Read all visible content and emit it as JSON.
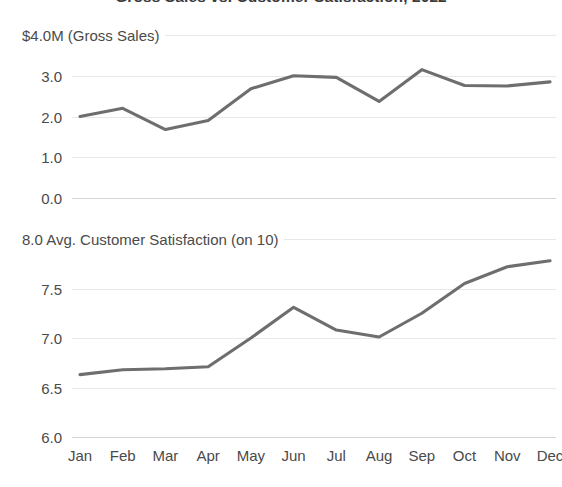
{
  "chart_data": {
    "type": "line",
    "title": "Gross Sales vs. Customer Satisfaction, 2022",
    "xlabel": "",
    "grid": true,
    "legend": "none",
    "categories": [
      "Jan",
      "Feb",
      "Mar",
      "Apr",
      "May",
      "Jun",
      "Jul",
      "Aug",
      "Sep",
      "Oct",
      "Nov",
      "Dec"
    ],
    "panels": [
      {
        "name": "gross-sales",
        "ylabel": "$4.0M (Gross Sales)",
        "unit_label": "$4.0M (Gross Sales)",
        "yticks": [
          "0.0",
          "1.0",
          "2.0",
          "3.0"
        ],
        "ytick_values": [
          0.0,
          1.0,
          2.0,
          3.0
        ],
        "ylim": [
          0.0,
          4.0
        ],
        "series": [
          {
            "name": "Gross Sales",
            "color": "#6e6e6e",
            "values": [
              2.0,
              2.2,
              1.68,
              1.9,
              2.68,
              3.0,
              2.96,
              2.37,
              3.15,
              2.76,
              2.75,
              2.85
            ]
          }
        ]
      },
      {
        "name": "customer-satisfaction",
        "ylabel": "8.0 Avg. Customer Satisfaction (on 10)",
        "unit_label": "8.0 Avg. Customer Satisfaction (on 10)",
        "yticks": [
          "6.0",
          "6.5",
          "7.0",
          "7.5"
        ],
        "ytick_values": [
          6.0,
          6.5,
          7.0,
          7.5
        ],
        "ylim": [
          6.0,
          8.0
        ],
        "series": [
          {
            "name": "Avg. Customer Satisfaction",
            "color": "#6e6e6e",
            "values": [
              6.63,
              6.68,
              6.69,
              6.71,
              7.0,
              7.31,
              7.08,
              7.01,
              7.25,
              7.55,
              7.72,
              7.78
            ]
          }
        ]
      }
    ],
    "colors": {
      "line": "#6e6e6e",
      "grid": "#e8e8e8",
      "text": "#4a4a4a",
      "background": "#ffffff"
    }
  }
}
